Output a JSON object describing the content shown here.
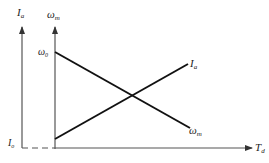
{
  "diagram": {
    "title": "",
    "axes": {
      "left_axis_label": "I",
      "left_axis_subscript": "a",
      "right_axis_label": "ω",
      "right_axis_subscript": "m",
      "x_axis_label": "T",
      "x_axis_subscript": "d"
    },
    "markers": {
      "omega0_label": "ω",
      "omega0_subscript": "0",
      "io_label": "I",
      "io_subscript": "o"
    },
    "curves": [
      {
        "name": "armature-current",
        "label": "I",
        "subscript": "a",
        "trend": "increasing"
      },
      {
        "name": "motor-speed",
        "label": "ω",
        "subscript": "m",
        "trend": "decreasing"
      }
    ],
    "colors": {
      "axis": "#555555",
      "line": "#111111"
    }
  }
}
